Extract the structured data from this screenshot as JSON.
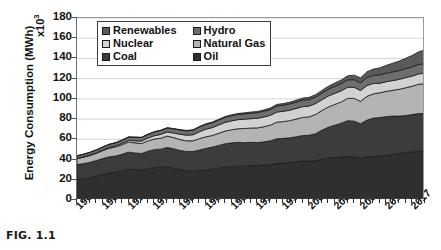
{
  "figure": {
    "caption": "FIG. 1.1"
  },
  "chart_data": {
    "type": "area",
    "stacked": true,
    "title": "",
    "xlabel": "",
    "ylabel": "Energy Consumption (MWh)",
    "y_exponent": "x10",
    "y_exponent_power": "3",
    "ylim": [
      0,
      180
    ],
    "ytick_step": 20,
    "yticks": [
      0,
      20,
      40,
      60,
      80,
      100,
      120,
      140,
      160,
      180
    ],
    "xlim": [
      1965,
      2019
    ],
    "xticks": [
      1965,
      1969,
      1973,
      1977,
      1981,
      1985,
      1989,
      1993,
      1997,
      2001,
      2005,
      2009,
      2013,
      2017
    ],
    "minor_xtick_step": 1,
    "grid": "horizontal",
    "legend_position": "top-left-inside",
    "legend_columns": 2,
    "x": [
      1965,
      1966,
      1967,
      1968,
      1969,
      1970,
      1971,
      1972,
      1973,
      1974,
      1975,
      1976,
      1977,
      1978,
      1979,
      1980,
      1981,
      1982,
      1983,
      1984,
      1985,
      1986,
      1987,
      1988,
      1989,
      1990,
      1991,
      1992,
      1993,
      1994,
      1995,
      1996,
      1997,
      1998,
      1999,
      2000,
      2001,
      2002,
      2003,
      2004,
      2005,
      2006,
      2007,
      2008,
      2009,
      2010,
      2011,
      2012,
      2013,
      2014,
      2015,
      2016,
      2017,
      2018,
      2019
    ],
    "series": [
      {
        "name": "Oil",
        "color": "#2f2f2f",
        "values": [
          20,
          21,
          22,
          23.5,
          25,
          26.5,
          27.5,
          29,
          30.5,
          30,
          29.5,
          31,
          32,
          32.5,
          33,
          31.5,
          30,
          29,
          28.5,
          29,
          29.5,
          30.5,
          31.5,
          32.5,
          33,
          33.5,
          33.5,
          34,
          34,
          34.5,
          35,
          36,
          36.5,
          37,
          38,
          38.5,
          38.5,
          39,
          40,
          41.5,
          42,
          42.5,
          43,
          42.5,
          41.5,
          42.5,
          43,
          43.5,
          44,
          45,
          46,
          47,
          47.5,
          48,
          48.5
        ]
      },
      {
        "name": "Coal",
        "color": "#3c3c3c",
        "values": [
          15,
          15,
          15.2,
          15.5,
          16,
          16.2,
          16,
          16.2,
          16.8,
          16.5,
          16.5,
          17.2,
          17.8,
          17.8,
          19,
          19.2,
          19,
          19,
          19.5,
          20.5,
          21.5,
          21.8,
          22.5,
          23.2,
          23.5,
          23.5,
          23.2,
          23,
          22.8,
          23,
          23.5,
          24.5,
          24.5,
          24.5,
          24.5,
          25.2,
          25.5,
          26.5,
          29,
          30.5,
          32,
          33.5,
          35.5,
          35.5,
          34,
          36.5,
          38,
          38,
          38.5,
          38,
          37,
          36.5,
          37,
          37.5,
          37
        ]
      },
      {
        "name": "Natural Gas",
        "color": "#b4b4b4",
        "values": [
          6,
          6.3,
          6.8,
          7.2,
          7.8,
          8.5,
          9,
          9.5,
          10,
          10,
          9.8,
          10.2,
          10.5,
          10.8,
          11.2,
          11,
          10.8,
          10.5,
          10.5,
          11.2,
          11.5,
          11.5,
          12,
          12.5,
          13,
          13.5,
          14,
          14.2,
          14.5,
          15,
          15.5,
          16.5,
          16.5,
          17,
          17.5,
          18,
          18.2,
          19,
          19.5,
          20,
          20.5,
          21,
          22,
          22.5,
          22,
          23.5,
          24,
          24.5,
          25,
          25.5,
          26.5,
          27.5,
          28,
          29,
          29.5
        ]
      },
      {
        "name": "Nuclear",
        "color": "#d2d2d2",
        "values": [
          0.2,
          0.3,
          0.4,
          0.5,
          0.6,
          0.8,
          1,
          1.3,
          1.6,
          2,
          2.4,
          2.8,
          3.3,
          3.8,
          4,
          4.5,
          5.2,
          5.6,
          6,
          6.8,
          7.5,
          7.8,
          8.2,
          8.6,
          8.8,
          9,
          9.2,
          9.3,
          9.5,
          9.6,
          9.8,
          10,
          10.2,
          10.3,
          10.5,
          10.6,
          10.7,
          10.8,
          10.6,
          10.8,
          11,
          11,
          11,
          11,
          10.8,
          10.8,
          10.2,
          9.5,
          9.5,
          9.6,
          9.8,
          10,
          10,
          10.2,
          10.5
        ]
      },
      {
        "name": "Hydro",
        "color": "#6e6e6e",
        "values": [
          2.5,
          2.6,
          2.7,
          2.8,
          3,
          3,
          3.1,
          3.2,
          3.3,
          3.5,
          3.6,
          3.6,
          3.7,
          3.9,
          4,
          4.1,
          4.2,
          4.3,
          4.5,
          4.7,
          4.8,
          4.9,
          4.9,
          5,
          5.1,
          5.2,
          5.3,
          5.4,
          5.6,
          5.7,
          5.8,
          6,
          6.1,
          6.2,
          6.3,
          6.4,
          6.4,
          6.5,
          6.6,
          6.8,
          7,
          7.1,
          7.3,
          7.5,
          7.6,
          7.9,
          8,
          8.2,
          8.4,
          8.6,
          8.7,
          8.9,
          9.1,
          9.3,
          9.5
        ]
      },
      {
        "name": "Renewables",
        "color": "#5a5a5a",
        "values": [
          0.1,
          0.1,
          0.1,
          0.1,
          0.1,
          0.15,
          0.15,
          0.2,
          0.2,
          0.2,
          0.25,
          0.25,
          0.3,
          0.3,
          0.35,
          0.4,
          0.4,
          0.45,
          0.5,
          0.55,
          0.6,
          0.65,
          0.7,
          0.8,
          0.85,
          0.9,
          1,
          1.1,
          1.2,
          1.3,
          1.4,
          1.5,
          1.6,
          1.7,
          1.9,
          2.1,
          2.2,
          2.4,
          2.6,
          2.9,
          3.2,
          3.6,
          4,
          4.5,
          4.9,
          5.6,
          6.3,
          7,
          7.8,
          8.6,
          9.4,
          10.3,
          11.3,
          12.5,
          13.5
        ]
      }
    ]
  },
  "legend": {
    "columns": [
      {
        "items": [
          {
            "label": "Renewables",
            "color": "#5a5a5a"
          },
          {
            "label": "Nuclear",
            "color": "#d2d2d2"
          },
          {
            "label": "Coal",
            "color": "#3c3c3c"
          }
        ]
      },
      {
        "items": [
          {
            "label": "Hydro",
            "color": "#6e6e6e"
          },
          {
            "label": "Natural Gas",
            "color": "#b4b4b4"
          },
          {
            "label": "Oil",
            "color": "#2f2f2f"
          }
        ]
      }
    ]
  }
}
